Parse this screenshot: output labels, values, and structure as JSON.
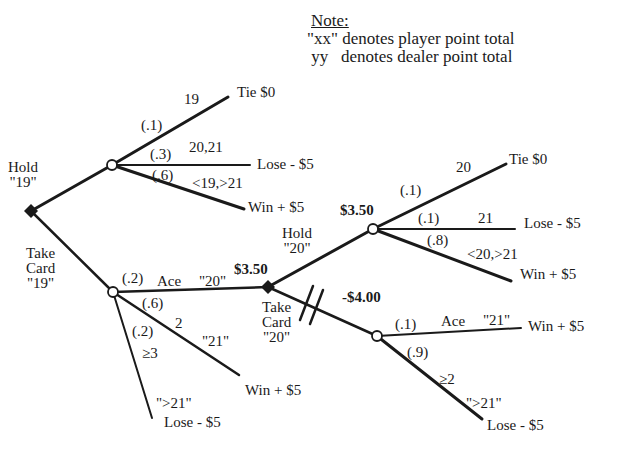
{
  "note": {
    "title": "Note:",
    "line1": "\"xx\" denotes player point total",
    "line2": " yy   denotes dealer point total"
  },
  "nodes": {
    "decision_19": {
      "label_hold": "Hold",
      "label_hold_total": "\"19\"",
      "label_take": "Take",
      "label_card": "Card",
      "label_take_total": "\"19\""
    },
    "decision_20": {
      "value": "$3.50",
      "label_hold": "Hold",
      "label_hold_total": "\"20\"",
      "label_take": "Take",
      "label_card": "Card",
      "label_take_total": "\"20\""
    },
    "chance_hold_20": {
      "value": "$3.50"
    },
    "chance_take_20": {
      "value": "-$4.00"
    }
  },
  "branches": {
    "hold19": [
      {
        "prob": "(.1)",
        "dealer": "19",
        "outcome": "Tie $0"
      },
      {
        "prob": "(.3)",
        "dealer": "20,21",
        "outcome": "Lose - $5"
      },
      {
        "prob": "(.6)",
        "dealer": "<19,>21",
        "outcome": "Win + $5"
      }
    ],
    "take19": [
      {
        "prob": "(.2)",
        "card": "Ace",
        "player": "\"20\""
      },
      {
        "prob": "(.6)",
        "card": "2",
        "player": "\"21\"",
        "outcome": "Win + $5"
      },
      {
        "prob": "(.2)",
        "card": "≥3",
        "player": "\">21\"",
        "outcome": "Lose - $5"
      }
    ],
    "hold20": [
      {
        "prob": "(.1)",
        "dealer": "20",
        "outcome": "Tie $0"
      },
      {
        "prob": "(.1)",
        "dealer": "21",
        "outcome": "Lose - $5"
      },
      {
        "prob": "(.8)",
        "dealer": "<20,>21",
        "outcome": "Win + $5"
      }
    ],
    "take20": [
      {
        "prob": "(.1)",
        "card": "Ace",
        "player": "\"21\"",
        "outcome": "Win + $5"
      },
      {
        "prob": "(.9)",
        "card": "≥2",
        "player": "\">21\"",
        "outcome": "Lose - $5"
      }
    ]
  },
  "colors": {
    "line": "#1a1a1a",
    "background": "#ffffff"
  }
}
